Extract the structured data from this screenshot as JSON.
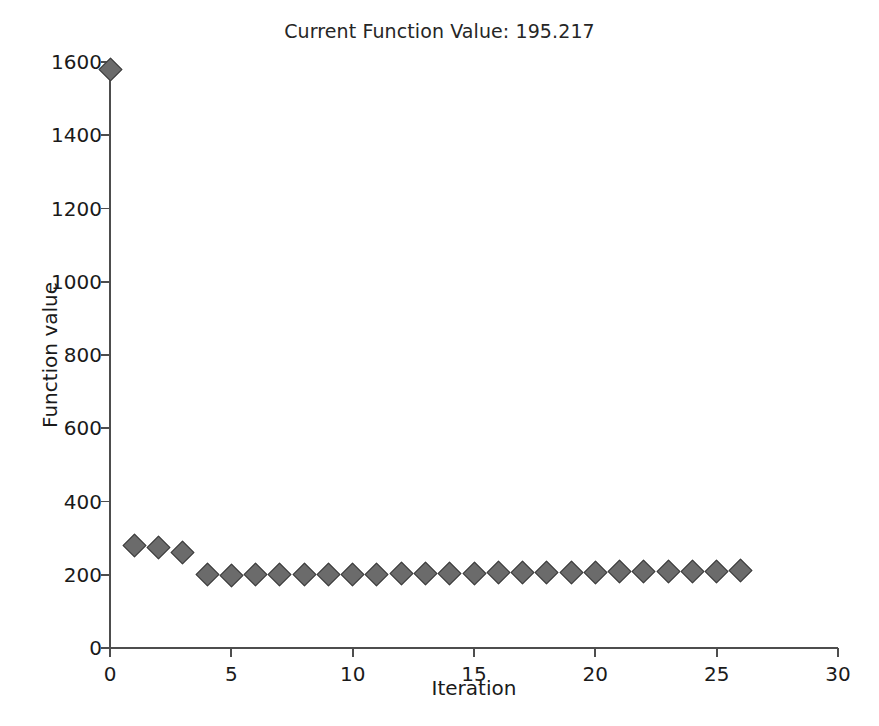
{
  "chart_data": {
    "type": "scatter",
    "title": "Current Function Value: 195.217",
    "xlabel": "Iteration",
    "ylabel": "Function value",
    "xlim": [
      0,
      30
    ],
    "ylim": [
      0,
      1600
    ],
    "xticks": [
      0,
      5,
      10,
      15,
      20,
      25,
      30
    ],
    "yticks": [
      0,
      200,
      400,
      600,
      800,
      1000,
      1200,
      1400,
      1600
    ],
    "grid": false,
    "legend": null,
    "marker": {
      "shape": "diamond",
      "face_color": "#6b6b6b",
      "edge_color": "#3d3d3d",
      "size": 17
    },
    "x": [
      0,
      1,
      2,
      3,
      4,
      5,
      6,
      7,
      8,
      9,
      10,
      11,
      12,
      13,
      14,
      15,
      16,
      17,
      18,
      19,
      20,
      21,
      22,
      23,
      24,
      25,
      26
    ],
    "values": [
      1580,
      280,
      275,
      262,
      201,
      199,
      200,
      200,
      201,
      200,
      201,
      202,
      203,
      203,
      204,
      204,
      205,
      206,
      206,
      207,
      207,
      208,
      208,
      209,
      209,
      210,
      211
    ],
    "series": [
      {
        "name": "Current Function Value",
        "values": [
          1580,
          280,
          275,
          262,
          201,
          199,
          200,
          200,
          201,
          200,
          201,
          202,
          203,
          203,
          204,
          204,
          205,
          206,
          206,
          207,
          207,
          208,
          208,
          209,
          209,
          210,
          211
        ]
      }
    ],
    "current_function_value": "195.217"
  }
}
